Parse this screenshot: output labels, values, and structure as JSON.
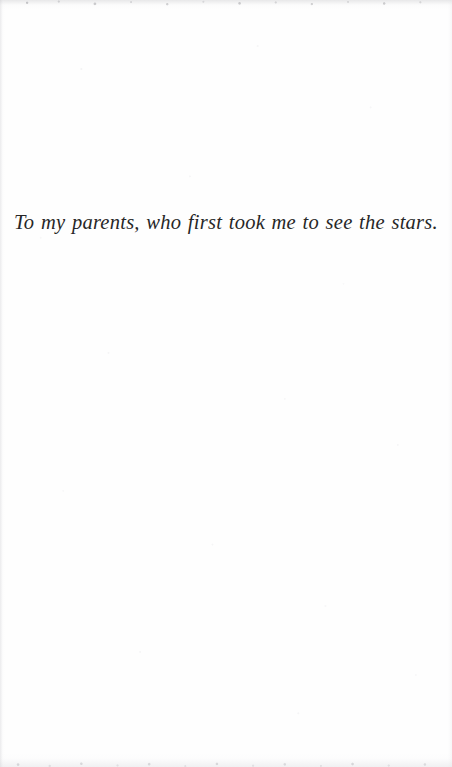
{
  "page": {
    "kind": "book-dedication-page",
    "background_color": "#fefefe",
    "width": 452,
    "height": 767
  },
  "dedication": {
    "text": "To my parents, who first took me to see the stars.",
    "style": "italic-serif",
    "alignment": "center",
    "text_color": "#272727"
  },
  "artifacts": {
    "top_edge": "scan-edge-noise",
    "bottom_edge": "scan-edge-noise",
    "left_edge": "scan-edge-shadow",
    "right_edge": "scan-edge-shadow",
    "field": "paper-grain-speckle"
  }
}
